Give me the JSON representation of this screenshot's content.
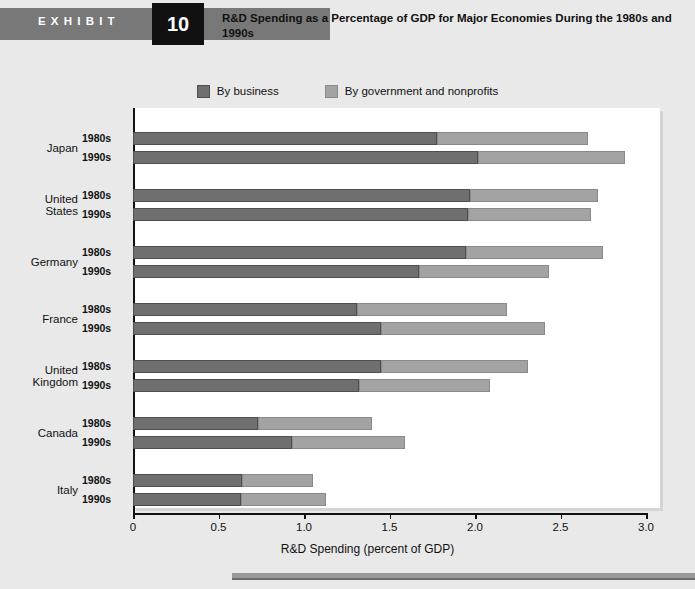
{
  "exhibit": {
    "word": "EXHIBIT",
    "number": "10",
    "title": "R&D Spending as a Percentage of GDP for Major Economies During the 1980s and 1990s"
  },
  "colors": {
    "business": "#6f6f6f",
    "government": "#a3a3a3",
    "header_band": "#787878",
    "number_box": "#111111",
    "page_background": "#e9e9e9",
    "plot_background": "#ffffff",
    "axis": "#111111"
  },
  "legend": {
    "items": [
      {
        "label": "By business",
        "color": "#6f6f6f",
        "swatch": "business-swatch"
      },
      {
        "label": "By government and nonprofits",
        "color": "#a3a3a3",
        "swatch": "government-swatch"
      }
    ]
  },
  "axis": {
    "x_title": "R&D Spending (percent of GDP)",
    "x_ticks": [
      "0",
      "0.5",
      "1.0",
      "1.5",
      "2.0",
      "2.5",
      "3.0"
    ],
    "x_tick_values": [
      0,
      0.5,
      1.0,
      1.5,
      2.0,
      2.5,
      3.0
    ],
    "x_min": 0,
    "x_max": 3.0
  },
  "chart_data": {
    "type": "bar",
    "orientation": "horizontal",
    "stacked": true,
    "title": "R&D Spending as a Percentage of GDP for Major Economies During the 1980s and 1990s",
    "xlabel": "R&D Spending (percent of GDP)",
    "ylabel": "",
    "xlim": [
      0,
      3.0
    ],
    "grid": false,
    "legend_position": "top-center",
    "categories": [
      "Japan 1980s",
      "Japan 1990s",
      "United States 1980s",
      "United States 1990s",
      "Germany 1980s",
      "Germany 1990s",
      "France 1980s",
      "France 1990s",
      "United Kingdom 1980s",
      "United Kingdom 1990s",
      "Canada 1980s",
      "Canada 1990s",
      "Italy 1980s",
      "Italy 1990s"
    ],
    "series": [
      {
        "name": "By business",
        "color": "#6f6f6f",
        "values": [
          1.78,
          2.02,
          1.97,
          1.96,
          1.95,
          1.67,
          1.31,
          1.45,
          1.45,
          1.32,
          0.73,
          0.93,
          0.64,
          0.63
        ]
      },
      {
        "name": "By government and nonprofits",
        "color": "#a3a3a3",
        "values": [
          0.88,
          0.86,
          0.75,
          0.72,
          0.8,
          0.76,
          0.88,
          0.96,
          0.86,
          0.77,
          0.67,
          0.66,
          0.41,
          0.5
        ]
      }
    ],
    "totals": [
      2.66,
      2.88,
      2.72,
      2.68,
      2.75,
      2.43,
      2.19,
      2.41,
      2.31,
      2.09,
      1.4,
      1.59,
      1.05,
      1.13
    ],
    "groups": [
      {
        "country": "Japan",
        "rows": [
          {
            "period": "1980s",
            "business": 1.78,
            "government": 0.88,
            "total": 2.66
          },
          {
            "period": "1990s",
            "business": 2.02,
            "government": 0.86,
            "total": 2.88
          }
        ]
      },
      {
        "country": "United States",
        "country_lines": [
          "United",
          "States"
        ],
        "rows": [
          {
            "period": "1980s",
            "business": 1.97,
            "government": 0.75,
            "total": 2.72
          },
          {
            "period": "1990s",
            "business": 1.96,
            "government": 0.72,
            "total": 2.68
          }
        ]
      },
      {
        "country": "Germany",
        "country_lines": [
          "Germany"
        ],
        "rows": [
          {
            "period": "1980s",
            "business": 1.95,
            "government": 0.8,
            "total": 2.75
          },
          {
            "period": "1990s",
            "business": 1.67,
            "government": 0.76,
            "total": 2.43
          }
        ]
      },
      {
        "country": "France",
        "country_lines": [
          "France"
        ],
        "rows": [
          {
            "period": "1980s",
            "business": 1.31,
            "government": 0.88,
            "total": 2.19
          },
          {
            "period": "1990s",
            "business": 1.45,
            "government": 0.96,
            "total": 2.41
          }
        ]
      },
      {
        "country": "United Kingdom",
        "country_lines": [
          "United",
          "Kingdom"
        ],
        "rows": [
          {
            "period": "1980s",
            "business": 1.45,
            "government": 0.86,
            "total": 2.31
          },
          {
            "period": "1990s",
            "business": 1.32,
            "government": 0.77,
            "total": 2.09
          }
        ]
      },
      {
        "country": "Canada",
        "country_lines": [
          "Canada"
        ],
        "rows": [
          {
            "period": "1980s",
            "business": 0.73,
            "government": 0.67,
            "total": 1.4
          },
          {
            "period": "1990s",
            "business": 0.93,
            "government": 0.66,
            "total": 1.59
          }
        ]
      },
      {
        "country": "Italy",
        "country_lines": [
          "Italy"
        ],
        "rows": [
          {
            "period": "1980s",
            "business": 0.64,
            "government": 0.41,
            "total": 1.05
          },
          {
            "period": "1990s",
            "business": 0.63,
            "government": 0.5,
            "total": 1.13
          }
        ]
      }
    ]
  }
}
